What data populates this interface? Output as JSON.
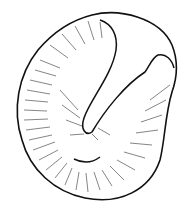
{
  "illustration": {
    "subject": "seed line drawing",
    "stroke_color": "#111111",
    "background": "#ffffff"
  }
}
